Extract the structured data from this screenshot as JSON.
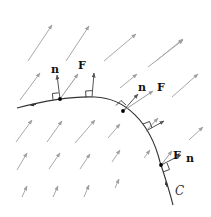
{
  "diagram": {
    "colors": {
      "field_arrow": "#a8a8a8",
      "curve": "#333333",
      "vector": "#555555",
      "point": "#000000"
    },
    "labels": {
      "point1_n": "n",
      "point1_F": "F",
      "point2_n": "n",
      "point2_F": "F",
      "point3_F": "F",
      "point3_n": "n",
      "curve": "C"
    }
  }
}
